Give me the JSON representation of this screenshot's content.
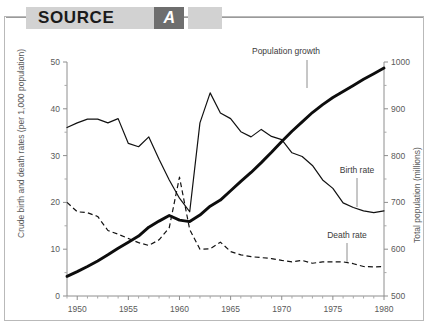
{
  "banner": {
    "title": "SOURCE",
    "badge": "A"
  },
  "chart_data": {
    "type": "line",
    "title": "",
    "xlabel": "",
    "ylabel": "Crude birth and death rates (per 1,000 population)",
    "y2label": "Total population (millions)",
    "xlim": [
      1949,
      1980
    ],
    "ylim": [
      0,
      50
    ],
    "y2lim": [
      500,
      1000
    ],
    "yticks": [
      0,
      10,
      20,
      30,
      40,
      50
    ],
    "ytick_labels": [
      "0",
      "10",
      "20",
      "30",
      "40",
      "50"
    ],
    "y2ticks": [
      500,
      600,
      700,
      800,
      900,
      1000
    ],
    "y2tick_labels": [
      "500",
      "600",
      "700",
      "800",
      "900",
      "1000"
    ],
    "y_minor_step": 5,
    "y2_minor_step": 50,
    "xticks": [
      1950,
      1955,
      1960,
      1965,
      1970,
      1975,
      1980
    ],
    "xtick_labels": [
      "1950",
      "1955",
      "1960",
      "1965",
      "1970",
      "1975",
      "1980"
    ],
    "x_minor_step": 1,
    "grid": false,
    "legend_position": "inline-annotations",
    "annotations": [
      {
        "text": "Population growth",
        "series": "population",
        "x": 1974.5,
        "y_axis": "right"
      },
      {
        "text": "Birth rate",
        "series": "birth_rate",
        "x": 1977.0,
        "y_axis": "left"
      },
      {
        "text": "Death rate",
        "series": "death_rate",
        "x": 1977.0,
        "y_axis": "left"
      }
    ],
    "series": [
      {
        "name": "Birth rate",
        "axis": "left",
        "style": "solid-thin",
        "x": [
          1949,
          1950,
          1951,
          1952,
          1953,
          1954,
          1955,
          1956,
          1957,
          1958,
          1959,
          1960,
          1961,
          1962,
          1963,
          1964,
          1965,
          1966,
          1967,
          1968,
          1969,
          1970,
          1971,
          1972,
          1973,
          1974,
          1975,
          1976,
          1977,
          1978,
          1979,
          1980
        ],
        "values": [
          36.0,
          37.0,
          37.8,
          37.8,
          37.0,
          37.9,
          32.6,
          31.9,
          34.0,
          29.2,
          24.8,
          20.9,
          18.0,
          37.0,
          43.4,
          39.1,
          37.9,
          35.1,
          34.0,
          35.6,
          34.1,
          33.4,
          30.6,
          29.8,
          27.9,
          24.8,
          23.0,
          19.9,
          18.9,
          18.2,
          17.8,
          18.2
        ]
      },
      {
        "name": "Death rate",
        "axis": "left",
        "style": "dashed-thin",
        "x": [
          1949,
          1950,
          1951,
          1952,
          1953,
          1954,
          1955,
          1956,
          1957,
          1958,
          1959,
          1960,
          1961,
          1962,
          1963,
          1964,
          1965,
          1966,
          1967,
          1968,
          1969,
          1970,
          1971,
          1972,
          1973,
          1974,
          1975,
          1976,
          1977,
          1978,
          1979,
          1980
        ],
        "values": [
          20.0,
          18.0,
          17.8,
          17.0,
          14.0,
          13.2,
          12.3,
          11.4,
          10.8,
          12.0,
          14.6,
          25.4,
          14.2,
          10.0,
          10.1,
          11.5,
          9.5,
          8.8,
          8.4,
          8.2,
          8.0,
          7.6,
          7.3,
          7.6,
          7.0,
          7.3,
          7.3,
          7.3,
          6.9,
          6.3,
          6.2,
          6.3
        ]
      },
      {
        "name": "Population growth",
        "axis": "right",
        "style": "solid-thick",
        "x": [
          1949,
          1950,
          1951,
          1952,
          1953,
          1954,
          1955,
          1956,
          1957,
          1958,
          1959,
          1960,
          1961,
          1962,
          1963,
          1964,
          1965,
          1966,
          1967,
          1968,
          1969,
          1970,
          1971,
          1972,
          1973,
          1974,
          1975,
          1976,
          1977,
          1978,
          1979,
          1980
        ],
        "values": [
          542,
          552,
          563,
          575,
          588,
          602,
          615,
          628,
          647,
          660,
          672,
          662,
          659,
          673,
          692,
          705,
          725,
          745,
          764,
          785,
          807,
          830,
          852,
          872,
          892,
          909,
          924,
          937,
          950,
          963,
          975,
          987
        ]
      }
    ]
  }
}
